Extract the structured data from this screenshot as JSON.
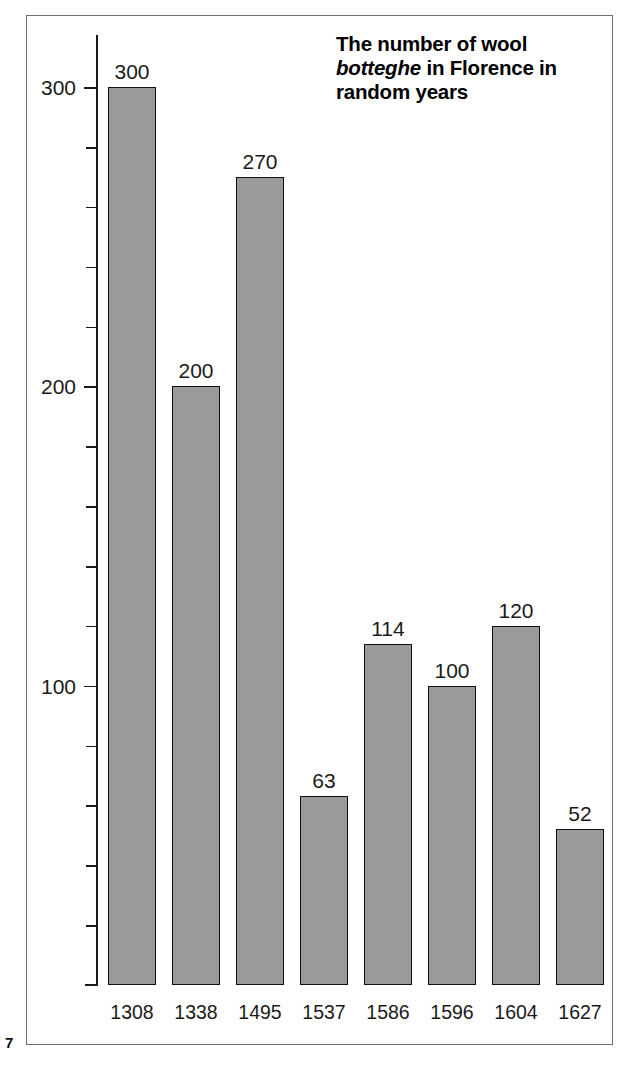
{
  "page": {
    "number": "7"
  },
  "title": {
    "line1_pre": "The number of wool",
    "emphasis": "botteghe",
    "line2_post": " in Florence in",
    "line3": "random years",
    "full": "The number of wool botteghe in Florence in random years"
  },
  "colors": {
    "bar_fill": "#9a9a9a",
    "bar_stroke": "#111111",
    "axis": "#1a1a1a",
    "frame": "#6f6f6f",
    "text": "#000000",
    "background": "#ffffff"
  },
  "chart_data": {
    "type": "bar",
    "title": "The number of wool botteghe in Florence in random years",
    "xlabel": "",
    "ylabel": "",
    "categories": [
      "1308",
      "1338",
      "1495",
      "1537",
      "1586",
      "1596",
      "1604",
      "1627"
    ],
    "values": [
      300,
      200,
      270,
      63,
      114,
      100,
      120,
      52
    ],
    "data_labels": [
      "300",
      "200",
      "270",
      "63",
      "114",
      "100",
      "120",
      "52"
    ],
    "ylim": [
      0,
      305
    ],
    "y_major_ticks": [
      100,
      200,
      300
    ],
    "y_major_tick_labels": [
      "100",
      "200",
      "300"
    ],
    "y_minor_ticks": [
      20,
      40,
      60,
      80,
      120,
      140,
      160,
      180,
      220,
      240,
      260,
      280
    ],
    "y_tick_interval": 20,
    "grid": false,
    "legend": false,
    "orientation": "vertical"
  }
}
